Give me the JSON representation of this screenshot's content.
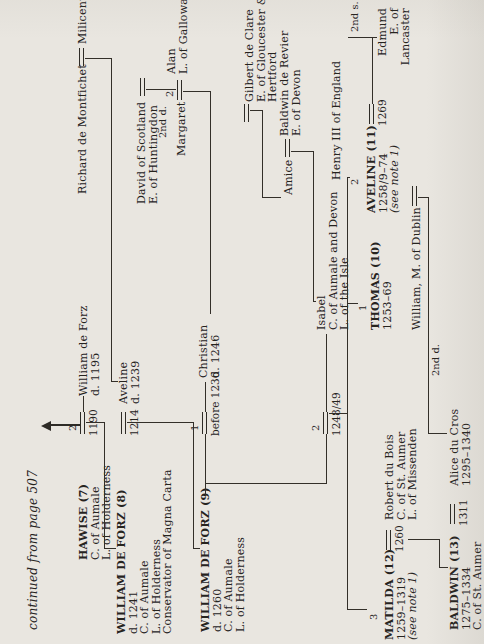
{
  "note": {
    "continued": "continued from page 507"
  },
  "paper": {
    "bg": "#e9e6e0",
    "ink": "#26231e",
    "line": "#332f29"
  },
  "nodes": [
    {
      "id": "hawise-7",
      "x": 84,
      "y": 78,
      "lines": [
        {
          "t": "HAWISE (7)",
          "b": 1
        },
        {
          "t": "C. of Aumale"
        },
        {
          "t": "L. of Holderness"
        }
      ]
    },
    {
      "id": "william-de-forz-d1195",
      "x": 248,
      "y": 78,
      "lines": [
        {
          "t": "William de Forz"
        },
        {
          "t": "d. 1195"
        }
      ]
    },
    {
      "id": "richard-de-montfichet",
      "x": 450,
      "y": 77,
      "lines": [
        {
          "t": "Richard de Montfichet"
        }
      ]
    },
    {
      "id": "milicent",
      "x": 600,
      "y": 77,
      "lines": [
        {
          "t": "Milicent"
        }
      ]
    },
    {
      "id": "william-de-forz-8",
      "x": 10,
      "y": 116,
      "lines": [
        {
          "t": "WILLIAM DE FORZ (8)",
          "b": 1
        },
        {
          "t": "d. 1241"
        },
        {
          "t": "C. of Aumale"
        },
        {
          "t": "L. of Holderness"
        },
        {
          "t": "Conservator of Magna Carta"
        }
      ]
    },
    {
      "id": "aveline-d1239",
      "x": 240,
      "y": 118,
      "lines": [
        {
          "t": "Aveline"
        },
        {
          "t": "d. 1239"
        }
      ]
    },
    {
      "id": "david-of-scotland",
      "x": 440,
      "y": 136,
      "lines": [
        {
          "t": "David of Scotland"
        },
        {
          "t": "E. of Huntingdon"
        }
      ]
    },
    {
      "id": "margaret",
      "x": 488,
      "y": 176,
      "lines": [
        {
          "t": "Margaret"
        }
      ]
    },
    {
      "id": "alan-of-galloway",
      "x": 570,
      "y": 166,
      "lines": [
        {
          "t": "Alan"
        },
        {
          "t": "L. of Galloway"
        }
      ]
    },
    {
      "id": "william-de-forz-9",
      "x": 12,
      "y": 200,
      "lines": [
        {
          "t": "WILLIAM DE FORZ (9)",
          "b": 1
        },
        {
          "t": "d. 1260"
        },
        {
          "t": "C. of Aumale"
        },
        {
          "t": "L. of Holderness"
        }
      ]
    },
    {
      "id": "christian",
      "x": 266,
      "y": 198,
      "lines": [
        {
          "t": "Christian"
        },
        {
          "t": "d. 1246"
        }
      ]
    },
    {
      "id": "gilbert-de-clare",
      "x": 542,
      "y": 244,
      "lines": [
        {
          "t": "Gilbert de Clare"
        },
        {
          "t": "E. of Gloucester &"
        },
        {
          "t": "Hertford"
        }
      ]
    },
    {
      "id": "amice",
      "x": 449,
      "y": 283,
      "lines": [
        {
          "t": "Amice"
        }
      ]
    },
    {
      "id": "baldwin-de-revier",
      "x": 508,
      "y": 279,
      "lines": [
        {
          "t": "Baldwin de Revier"
        },
        {
          "t": "E. of Devon"
        }
      ]
    },
    {
      "id": "isabel",
      "x": 314,
      "y": 316,
      "lines": [
        {
          "t": "Isabel"
        },
        {
          "t": "C. of Aumale and Devon"
        },
        {
          "t": "L. of the Isle"
        }
      ]
    },
    {
      "id": "henry-iii",
      "x": 464,
      "y": 331,
      "lines": [
        {
          "t": "Henry III of England"
        }
      ]
    },
    {
      "id": "thomas-10",
      "x": 314,
      "y": 370,
      "lines": [
        {
          "t": "THOMAS (10)",
          "b": 1
        },
        {
          "t": "1253–69"
        }
      ]
    },
    {
      "id": "aveline-11",
      "x": 431,
      "y": 366,
      "lines": [
        {
          "t": "AVELINE (11)",
          "b": 1
        },
        {
          "t": "1258/9–74"
        },
        {
          "t": "(see note 1)",
          "i": 1
        }
      ]
    },
    {
      "id": "edmund-of-lancaster",
      "x": 636,
      "y": 377,
      "align": "right",
      "lines": [
        {
          "t": "Edmund"
        },
        {
          "t": "E. of"
        },
        {
          "t": "Lancaster"
        }
      ]
    },
    {
      "id": "william-m-of-dublin",
      "x": 314,
      "y": 411,
      "lines": [
        {
          "t": "William, M. of Dublin"
        }
      ]
    },
    {
      "id": "matilda-12",
      "x": 4,
      "y": 384,
      "lines": [
        {
          "t": "MATILDA (12)",
          "b": 1
        },
        {
          "t": "1259–1319"
        },
        {
          "t": "(see note 1)",
          "i": 1
        }
      ]
    },
    {
      "id": "robert-du-bois",
      "x": 124,
      "y": 384,
      "lines": [
        {
          "t": "Robert du Bois"
        },
        {
          "t": "C. of St. Aumer"
        },
        {
          "t": "L. of Missenden"
        }
      ]
    },
    {
      "id": "baldwin-13",
      "x": 14,
      "y": 449,
      "lines": [
        {
          "t": "BALDWIN (13)",
          "b": 1
        },
        {
          "t": "1275–1334"
        },
        {
          "t": "C. of St. Aumer"
        }
      ]
    },
    {
      "id": "alice-du-cros",
      "x": 158,
      "y": 449,
      "lines": [
        {
          "t": "Alice du Cros"
        },
        {
          "t": "1295–1340"
        }
      ]
    }
  ],
  "marriages": [
    {
      "id": "hawise-william",
      "x": 210,
      "y": 80,
      "w": 22,
      "num": "2",
      "date": "1190"
    },
    {
      "id": "william8-aveline",
      "x": 210,
      "y": 121,
      "w": 22,
      "num": "",
      "date": "1214"
    },
    {
      "id": "william9-christian",
      "x": 210,
      "y": 202,
      "w": 22,
      "num": "1",
      "date": "before 1236"
    },
    {
      "id": "william9-isabel",
      "x": 210,
      "y": 323,
      "w": 22,
      "num": "2",
      "date": "1248/49"
    },
    {
      "id": "richard-milicent",
      "x": 578,
      "y": 79,
      "w": 18,
      "num": "",
      "date": ""
    },
    {
      "id": "david-unnamed",
      "x": 548,
      "y": 140,
      "w": 18,
      "num": "",
      "date": ""
    },
    {
      "id": "margaret-alan",
      "x": 544,
      "y": 177,
      "w": 20,
      "num": "2",
      "date": ""
    },
    {
      "id": "gilbert-unnamed",
      "x": 522,
      "y": 244,
      "w": 18,
      "num": "",
      "date": ""
    },
    {
      "id": "amice-baldwin",
      "x": 487,
      "y": 285,
      "w": 18,
      "num": "",
      "date": ""
    },
    {
      "id": "aveline11-edmund",
      "x": 520,
      "y": 369,
      "w": 20,
      "num": "",
      "date": "1269"
    },
    {
      "id": "williamdublin-unnamed",
      "x": 438,
      "y": 412,
      "w": 20,
      "num": "",
      "date": ""
    },
    {
      "id": "matilda-robert",
      "x": 94,
      "y": 386,
      "w": 20,
      "num": "",
      "date": "1260"
    },
    {
      "id": "baldwin13-alice",
      "x": 120,
      "y": 450,
      "w": 20,
      "num": "",
      "date": "1311"
    }
  ],
  "labels": [
    {
      "t": "2nd d.",
      "x": 506,
      "y": 158
    },
    {
      "t": "2nd s.",
      "x": 612,
      "y": 350
    },
    {
      "t": "2nd d.",
      "x": 268,
      "y": 431
    },
    {
      "t": "3",
      "x": 24,
      "y": 369
    },
    {
      "t": "1",
      "x": 333,
      "y": 358
    },
    {
      "t": "2",
      "x": 459,
      "y": 350
    }
  ],
  "lines": [
    [
      232,
      83,
      16,
      1
    ],
    [
      221,
      86,
      1,
      18
    ],
    [
      95,
      104,
      127,
      1
    ],
    [
      95,
      104,
      1,
      12
    ],
    [
      585,
      85,
      1,
      26
    ],
    [
      262,
      111,
      324,
      1
    ],
    [
      262,
      111,
      1,
      7
    ],
    [
      221,
      127,
      1,
      66
    ],
    [
      95,
      193,
      127,
      1
    ],
    [
      95,
      193,
      1,
      7
    ],
    [
      554,
      146,
      1,
      30
    ],
    [
      552,
      183,
      1,
      27
    ],
    [
      330,
      210,
      223,
      1
    ],
    [
      148,
      205,
      62,
      1
    ],
    [
      160,
      205,
      1,
      121
    ],
    [
      160,
      326,
      50,
      1
    ],
    [
      232,
      205,
      30,
      1
    ],
    [
      533,
      250,
      1,
      12
    ],
    [
      446,
      262,
      88,
      1
    ],
    [
      446,
      262,
      1,
      19
    ],
    [
      492,
      291,
      1,
      22
    ],
    [
      342,
      313,
      151,
      1
    ],
    [
      342,
      313,
      1,
      3
    ],
    [
      232,
      326,
      78,
      1
    ],
    [
      230,
      329,
      1,
      18
    ],
    [
      34,
      347,
      433,
      1
    ],
    [
      34,
      347,
      1,
      20
    ],
    [
      340,
      347,
      1,
      11
    ],
    [
      466,
      347,
      1,
      3
    ],
    [
      606,
      348,
      1,
      29
    ],
    [
      540,
      372,
      66,
      1
    ],
    [
      446,
      418,
      1,
      10
    ],
    [
      210,
      428,
      237,
      1
    ],
    [
      210,
      428,
      1,
      19
    ],
    [
      104,
      408,
      1,
      31
    ],
    [
      76,
      439,
      29,
      1
    ],
    [
      76,
      439,
      1,
      9
    ]
  ],
  "arrow": {
    "head_x": 213,
    "head_y": 41,
    "shaft_x": 218,
    "shaft_y": 51,
    "shaft_h": 30
  }
}
